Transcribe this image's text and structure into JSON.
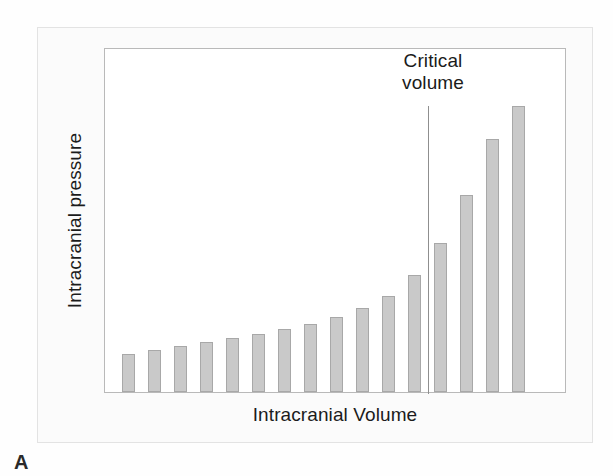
{
  "figure": {
    "panel_letter": "A",
    "annotation": {
      "line1": "Critical",
      "line2": "volume"
    }
  },
  "colors": {
    "bar_fill": "#c9c9c9",
    "bar_stroke": "#a8a8a8",
    "plot_border": "#b9b9b9",
    "outer_border": "#e3e3e3",
    "page_background": "#fbfbfb",
    "plot_background": "#ffffff",
    "text": "#1b1b1b",
    "marker_line": "#8f8f8f"
  },
  "chart_data": {
    "type": "bar",
    "title": "",
    "xlabel": "Intracranial Volume",
    "ylabel": "Intracranial pressure",
    "grid": false,
    "legend": null,
    "xlim": [
      0,
      16
    ],
    "ylim": [
      0,
      345
    ],
    "x_tick_labels": [],
    "y_tick_labels": [],
    "categories": [
      "1",
      "2",
      "3",
      "4",
      "5",
      "6",
      "7",
      "8",
      "9",
      "10",
      "11",
      "12",
      "13",
      "14",
      "15",
      "16"
    ],
    "values": [
      38,
      42,
      46,
      50,
      54,
      58,
      63,
      68,
      75,
      84,
      96,
      117,
      149,
      197,
      253,
      286
    ],
    "annotations": [
      {
        "text": "Critical volume",
        "type": "vertical-line-with-label",
        "at_category_index": 12,
        "x_px": 323,
        "line_top_px": 57,
        "line_bottom_px": 345
      }
    ]
  }
}
